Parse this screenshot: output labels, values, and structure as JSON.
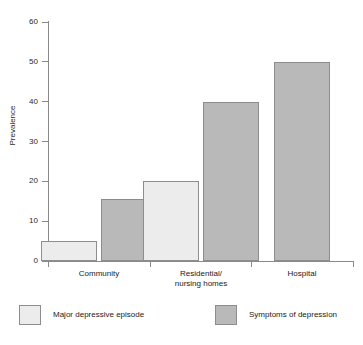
{
  "chart_data": {
    "type": "bar",
    "title": "",
    "xlabel": "",
    "ylabel": "Prevalence",
    "ylim": [
      0,
      60
    ],
    "ytick_labels": [
      "60",
      "50",
      "40",
      "30",
      "20",
      "10",
      "0"
    ],
    "yticks": [
      60,
      50,
      40,
      30,
      20,
      10,
      0
    ],
    "grid": false,
    "legend_position": "bottom",
    "categories": [
      "Community",
      "Residential/\nnursing homes",
      "Hospital"
    ],
    "series": [
      {
        "name": "Major depressive episode",
        "color": "#ececec",
        "values": [
          5,
          20,
          null
        ]
      },
      {
        "name": "Symptoms of depression",
        "color": "#b9b9b9",
        "values": [
          15.5,
          40,
          50
        ]
      }
    ]
  },
  "axes": {
    "y_title": "Prevalence",
    "y_tick_labels": [
      "60",
      "50",
      "40",
      "30",
      "20",
      "10",
      "0"
    ],
    "category_labels": [
      "Community",
      "Residential/\nnursing homes",
      "Hospital"
    ]
  },
  "legend": {
    "entries": [
      {
        "label": "Major depressive episode",
        "swatch": "light-gray-swatch"
      },
      {
        "label": "Symptoms of depression",
        "swatch": "dark-gray-swatch"
      }
    ]
  },
  "colors": {
    "series_light": "#ececec",
    "series_dark": "#b9b9b9",
    "bar_outline": "#8d8d8d",
    "axis": "#8a8a8a",
    "text": "#1a1a1a",
    "background": "#ffffff"
  }
}
